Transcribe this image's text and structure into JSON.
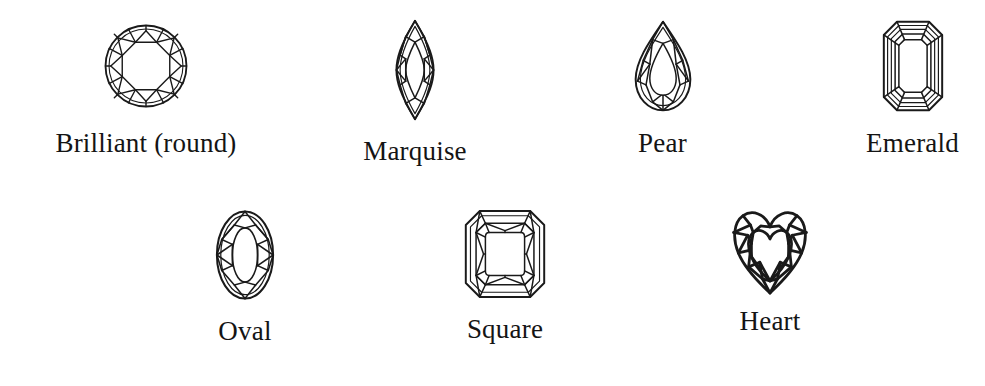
{
  "figure": {
    "background_color": "#ffffff",
    "line_color": "#1a1a1a",
    "rows": 2,
    "columns_top": 4,
    "columns_bottom": 3
  },
  "gems": [
    {
      "id": "brilliant",
      "label": "Brilliant (round)",
      "icon": "round-brilliant-diamond-icon",
      "row": 1,
      "column": 1,
      "outline_shape": "circle"
    },
    {
      "id": "marquise",
      "label": "Marquise",
      "icon": "marquise-diamond-icon",
      "row": 1,
      "column": 2,
      "outline_shape": "pointed-oval"
    },
    {
      "id": "pear",
      "label": "Pear",
      "icon": "pear-diamond-icon",
      "row": 1,
      "column": 3,
      "outline_shape": "teardrop"
    },
    {
      "id": "emerald",
      "label": "Emerald",
      "icon": "emerald-cut-diamond-icon",
      "row": 1,
      "column": 4,
      "outline_shape": "octagon-step-cut"
    },
    {
      "id": "oval",
      "label": "Oval",
      "icon": "oval-diamond-icon",
      "row": 2,
      "column": 1,
      "outline_shape": "ellipse"
    },
    {
      "id": "square",
      "label": "Square",
      "icon": "square-cut-diamond-icon",
      "row": 2,
      "column": 2,
      "outline_shape": "clipped-square"
    },
    {
      "id": "heart",
      "label": "Heart",
      "icon": "heart-diamond-icon",
      "row": 2,
      "column": 3,
      "outline_shape": "heart"
    }
  ]
}
